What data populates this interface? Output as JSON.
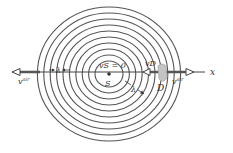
{
  "diagram": {
    "center": {
      "x": 109,
      "y": 74
    },
    "rings": {
      "count": 10,
      "inner_rx": 14,
      "inner_ry": 13,
      "step_x": 6.4,
      "step_y": 6.0,
      "color": "#555555"
    },
    "axis": {
      "label": "x"
    },
    "labels": {
      "source_velocity": "vS = 0",
      "source": "S",
      "detector": "D",
      "detector_velocity": "vD",
      "wavelength_left": "λ",
      "wavelength_diag": "λ",
      "wind_left": "v",
      "wind_left_sup": "air",
      "wind_right": "v",
      "wind_right_sup": "air"
    },
    "colors": {
      "stroke": "#444444",
      "detector_fill": "#bdbdbd"
    }
  }
}
